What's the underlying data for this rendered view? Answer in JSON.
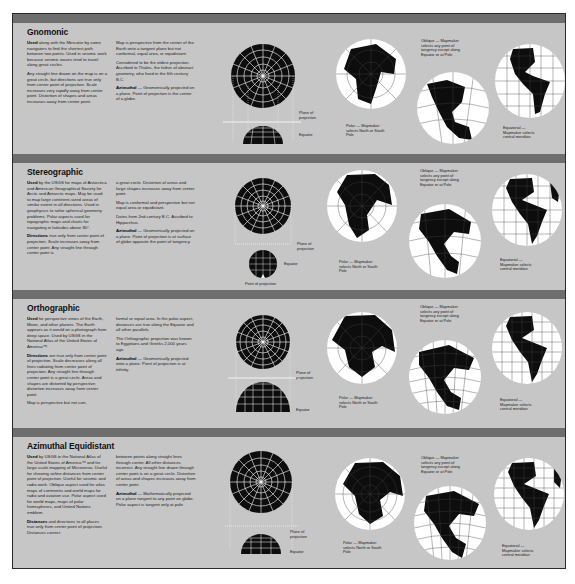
{
  "sections": [
    {
      "title": "Gnomonic",
      "col1": [
        {
          "bold": "Used",
          "text": " along with the Mercator by some navigators to find the shortest path between two points. Used in seismic work because seismic waves tend to travel along great circles."
        },
        {
          "bold": "",
          "text": "Any straight line drawn on the map is on a great circle, but directions are true only from center point of projection. Scale increases very rapidly away from center point. Distortion of shapes and areas increases away from center point."
        }
      ],
      "col2": [
        {
          "bold": "",
          "text": "Map is perspective from the center of the Earth onto a tangent plane but not conformal, equal area, or equidistant."
        },
        {
          "bold": "",
          "text": "Considered to be the oldest projection. Ascribed to Thales, the father of abstract geometry, who lived in the 6th century B.C."
        },
        {
          "bold": "Azimuthal",
          "text": " — Geometrically projected on a plane. Point of projection is the center of a globe."
        }
      ],
      "diagram_labels": [
        "Plane of projection",
        "Equator"
      ],
      "maps": [
        {
          "caption": "Polar — Mapmaker selects North or South Pole"
        },
        {
          "caption": "Oblique — Mapmaker selects any point of tangency except along Equator or at Pole"
        },
        {
          "caption": "Equatorial — Mapmaker selects central meridian"
        }
      ]
    },
    {
      "title": "Stereographic",
      "col1": [
        {
          "bold": "Used",
          "text": " by the USGS for maps of Antarctica and American Geographical Society for Arctic and Antarctic maps. May be used to map large continent-sized areas of similar extent in all directions. Used in geophysics to solve spherical geometry problems. Polar aspects used for topographic maps and charts for navigating in latitudes above 80°."
        },
        {
          "bold": "Directions",
          "text": " true only from center point of projection. Scale increases away from center point. Any straight line through center point is"
        }
      ],
      "col2": [
        {
          "bold": "",
          "text": "a great circle. Distortion of areas and large shapes increases away from center point."
        },
        {
          "bold": "",
          "text": "Map is conformal and perspective but not equal area or equidistant."
        },
        {
          "bold": "",
          "text": "Dates from 2nd century B.C. Ascribed to Hipparchus."
        },
        {
          "bold": "Azimuthal",
          "text": " — Geometrically projected on a plane. Point of projection is at surface of globe opposite the point of tangency."
        }
      ],
      "diagram_labels": [
        "Plane of projection",
        "Equator",
        "Point of projection"
      ],
      "maps": [
        {
          "caption": "Polar — Mapmaker selects North or South Pole"
        },
        {
          "caption": "Oblique — Mapmaker selects any point of tangency except along Equator or at Pole"
        },
        {
          "caption": "Equatorial — Mapmaker selects central meridian"
        }
      ]
    },
    {
      "title": "Orthographic",
      "col1": [
        {
          "bold": "Used",
          "text": " for perspective views of the Earth, Moon, and other planets. The Earth appears as it would on a photograph from deep space. Used by USGS in the National Atlas of the United States of America™."
        },
        {
          "bold": "Directions",
          "text": " are true only from center point of projection. Scale decreases along all lines radiating from center point of projection. Any straight line through center point is a great circle. Areas and shapes are distorted by perspective; distortion increases away from center point."
        },
        {
          "bold": "",
          "text": "Map is perspective but not con-"
        }
      ],
      "col2": [
        {
          "bold": "",
          "text": "formal or equal area. In the polar aspect, distances are true along the Equator and all other parallels."
        },
        {
          "bold": "",
          "text": "The Orthographic projection was known to Egyptians and Greeks 2,000 years ago."
        },
        {
          "bold": "Azimuthal",
          "text": " — Geometrically projected onto a plane. Point of projection is at infinity."
        }
      ],
      "diagram_labels": [
        "Plane of projection",
        "Equator"
      ],
      "maps": [
        {
          "caption": "Polar — Mapmaker selects North or South Pole"
        },
        {
          "caption": "Oblique — Mapmaker selects any point of tangency except along Equator or at Pole"
        },
        {
          "caption": "Equatorial — Mapmaker selects central meridian"
        }
      ]
    },
    {
      "title": "Azimuthal Equidistant",
      "col1": [
        {
          "bold": "Used",
          "text": " by USGS in the National Atlas of the United States of America™ and for large-scale mapping of Micronesia. Useful for showing airline distances from center point of projection. Useful for seismic and radio work. Oblique aspect used for atlas maps of continents and world maps for radio and aviation use. Polar aspect used for world maps, maps of polar hemispheres, and United Nations emblem."
        },
        {
          "bold": "Distances",
          "text": " and directions to all places true only from center point of projection. Distances correct"
        }
      ],
      "col2": [
        {
          "bold": "",
          "text": "between points along straight lines through center. All other distances incorrect. Any straight line drawn through center point is on a great circle. Distortion of areas and shapes increases away from center point."
        },
        {
          "bold": "Azimuthal",
          "text": " — Mathematically projected on a plane tangent to any point on globe. Polar aspect is tangent only at pole."
        }
      ],
      "diagram_labels": [
        "Plane of projection",
        "Equator"
      ],
      "maps": [
        {
          "caption": "Polar — Mapmaker selects North or South Pole"
        },
        {
          "caption": "Oblique — Mapmaker selects any point of tangency except along Equator or at Pole"
        },
        {
          "caption": "Equatorial — Mapmaker selects central meridian"
        }
      ]
    }
  ],
  "colors": {
    "panel": "#c6c6c6",
    "bar": "#6e6e6e",
    "land": "#0d0d0d",
    "ocean": "#ffffff",
    "border": "#2a2a2a"
  }
}
